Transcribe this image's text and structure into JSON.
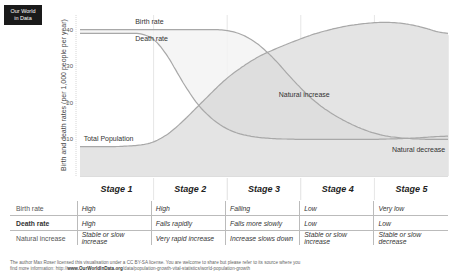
{
  "logo": {
    "line1": "Our World",
    "line2": "in Data"
  },
  "chart_data": {
    "type": "line",
    "title": "",
    "xlabel": "",
    "ylabel": "Birth and death rates (per 1,000 people per year)",
    "ylim": [
      0,
      44
    ],
    "xlim": [
      0,
      5
    ],
    "yticks": [
      10,
      20,
      30,
      40
    ],
    "categories": [
      "Stage 1",
      "Stage 2",
      "Stage 3",
      "Stage 4",
      "Stage 5"
    ],
    "grid": "vertical stage dividers",
    "series": [
      {
        "name": "Birth rate",
        "x": [
          0,
          0.5,
          1.0,
          1.5,
          2.0,
          2.3,
          2.6,
          2.9,
          3.2,
          3.5,
          3.8,
          4.1,
          4.4,
          4.7,
          5.0
        ],
        "values": [
          40,
          40,
          40,
          40,
          40,
          38,
          33,
          26,
          20,
          16,
          13,
          11,
          10.3,
          10,
          10
        ]
      },
      {
        "name": "Death rate",
        "x": [
          0,
          0.5,
          0.9,
          1.1,
          1.3,
          1.5,
          1.7,
          2.0,
          2.3,
          2.6,
          3.0,
          3.5,
          4.0,
          4.5,
          5.0
        ],
        "values": [
          39,
          39,
          39,
          36,
          29,
          22,
          17,
          12.5,
          10.8,
          10.2,
          10,
          10,
          10,
          10.3,
          11
        ]
      },
      {
        "name": "Total Population",
        "x": [
          0,
          0.5,
          0.9,
          1.1,
          1.3,
          1.6,
          2.0,
          2.4,
          2.8,
          3.2,
          3.6,
          4.0,
          4.3,
          4.6,
          5.0
        ],
        "values": [
          8,
          8,
          8.5,
          10,
          13,
          19,
          27,
          32.5,
          36,
          39,
          41,
          42,
          42,
          41,
          38.5
        ]
      }
    ],
    "annotations": [
      {
        "text": "Birth rate",
        "x": 0.75,
        "y": 41.5
      },
      {
        "text": "Death rate",
        "x": 0.75,
        "y": 37
      },
      {
        "text": "Total Population",
        "x": 0.05,
        "y": 9.5
      },
      {
        "text": "Natural increase",
        "x": 2.7,
        "y": 21.5
      },
      {
        "text": "Natural decrease",
        "x": 4.6,
        "y": 6.5
      }
    ]
  },
  "table": {
    "rows": [
      {
        "label": "Birth rate",
        "values": [
          "High",
          "High",
          "Falling",
          "Low",
          "Very low"
        ]
      },
      {
        "label": "Death rate",
        "values": [
          "High",
          "Falls rapidly",
          "Falls more slowly",
          "Low",
          "Low"
        ]
      },
      {
        "label": "Natural increase",
        "values": [
          "Stable or slow increase",
          "Very rapid increase",
          "Increase slows down",
          "Stable or slow increase",
          "Stable or slow decrease"
        ]
      }
    ]
  },
  "footer": {
    "text1": "The author Max Roser licensed this visualisation under a CC BY-SA license. You are welcome to share but please refer to its source where you",
    "text2": "find more information: http://",
    "link_bold": "www.OurWorldInData.org",
    "text3": "/data/population-growth-vital-statistics/world-population-growth"
  },
  "colors": {
    "line": "#a8a8a8",
    "fill_pop": "#e4e4e4",
    "fill_increase": "#f2f2f2",
    "fill_upper": "#dedede",
    "divider": "#e6e6e6"
  }
}
